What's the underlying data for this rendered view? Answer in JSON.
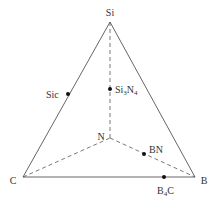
{
  "diagram": {
    "type": "ternary-tetrahedron-projection",
    "vertices": {
      "Si": {
        "label": "Si",
        "x": 110,
        "y": 22,
        "label_x": 110,
        "label_y": 16
      },
      "C": {
        "label": "C",
        "x": 23,
        "y": 177,
        "label_x": 13,
        "label_y": 184
      },
      "B": {
        "label": "B",
        "x": 195,
        "y": 177,
        "label_x": 204,
        "label_y": 184
      },
      "N": {
        "label": "N",
        "x": 110,
        "y": 138,
        "label_x": 101,
        "label_y": 140
      }
    },
    "compounds": [
      {
        "name": "sic",
        "label": "Sic",
        "x": 68,
        "y": 94,
        "label_x": 46,
        "label_y": 98,
        "anchor": "start"
      },
      {
        "name": "si3n4",
        "label_main": "Si",
        "sub1": "3",
        "label_mid": "N",
        "sub2": "4",
        "x": 110,
        "y": 89,
        "label_x": 115,
        "label_y": 93
      },
      {
        "name": "bn",
        "label": "BN",
        "x": 144,
        "y": 154,
        "label_x": 149,
        "label_y": 153,
        "anchor": "start"
      },
      {
        "name": "b4c",
        "label_main": "B",
        "sub1": "4",
        "label_mid": "C",
        "x": 164,
        "y": 177,
        "label_x": 157,
        "label_y": 194
      }
    ],
    "colors": {
      "line": "#555555",
      "point": "#111111",
      "text": "#333333"
    }
  }
}
